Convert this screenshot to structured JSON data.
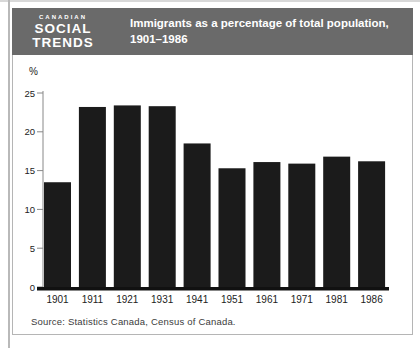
{
  "header": {
    "brand_top": "CANADIAN",
    "brand_mid": "SOCIAL",
    "brand_bot": "TRENDS",
    "title_line1": "Immigrants as a percentage of total population,",
    "title_line2": "1901–1986",
    "bg_color": "#6a6a6a",
    "text_color": "#ffffff"
  },
  "footer": {
    "source": "Source: Statistics Canada, Census of Canada."
  },
  "chart_data": {
    "type": "bar",
    "title": "Immigrants as a percentage of total population, 1901–1986",
    "categories": [
      "1901",
      "1911",
      "1921",
      "1931",
      "1941",
      "1951",
      "1961",
      "1971",
      "1981",
      "1986"
    ],
    "values": [
      13.5,
      23.2,
      23.4,
      23.3,
      18.5,
      15.3,
      16.1,
      15.9,
      16.8,
      16.2
    ],
    "xlabel": "",
    "ylabel": "%",
    "ylim": [
      0,
      25
    ],
    "yticks": [
      0,
      5,
      10,
      15,
      20,
      25
    ],
    "grid": false,
    "legend": false,
    "bar_color": "#1b1b1b",
    "axis_color": "#888888",
    "label_color": "#222222",
    "baseline_color": "#111111"
  }
}
